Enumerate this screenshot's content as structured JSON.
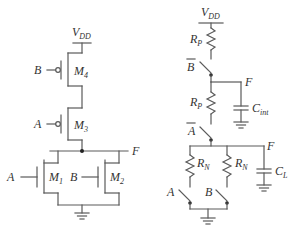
{
  "figure": {
    "left_circuit": {
      "title": "CMOS NOR gate",
      "supply_label": "V",
      "supply_sub": "DD",
      "output_label": "F",
      "transistors": [
        {
          "id": "M4",
          "name": "M",
          "sub": "4",
          "type": "pmos",
          "gate_input": "B"
        },
        {
          "id": "M3",
          "name": "M",
          "sub": "3",
          "type": "pmos",
          "gate_input": "A"
        },
        {
          "id": "M1",
          "name": "M",
          "sub": "1",
          "type": "nmos",
          "gate_input": "A"
        },
        {
          "id": "M2",
          "name": "M",
          "sub": "2",
          "type": "nmos",
          "gate_input": "B"
        }
      ]
    },
    "right_circuit": {
      "title": "Switch-level RC model",
      "supply_label": "V",
      "supply_sub": "DD",
      "pull_up_resistors": [
        {
          "name": "R",
          "sub": "P"
        },
        {
          "name": "R",
          "sub": "P"
        }
      ],
      "pull_up_switches": [
        {
          "label": "B",
          "inverted": true
        },
        {
          "label": "A",
          "inverted": true
        }
      ],
      "internal_node": {
        "label": "F",
        "cap_name": "C",
        "cap_sub": "int"
      },
      "output_node": {
        "label": "F",
        "cap_name": "C",
        "cap_sub": "L"
      },
      "pull_down_resistors": [
        {
          "name": "R",
          "sub": "N"
        },
        {
          "name": "R",
          "sub": "N"
        }
      ],
      "pull_down_switches": [
        {
          "label": "A",
          "inverted": false
        },
        {
          "label": "B",
          "inverted": false
        }
      ]
    }
  }
}
